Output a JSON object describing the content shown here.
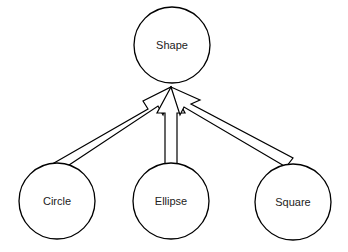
{
  "diagram": {
    "type": "inheritance",
    "nodes": [
      {
        "id": "shape",
        "label": "Shape",
        "cx": 172,
        "cy": 45,
        "r": 38
      },
      {
        "id": "circle",
        "label": "Circle",
        "cx": 57,
        "cy": 201,
        "r": 38
      },
      {
        "id": "ellipse",
        "label": "Ellipse",
        "cx": 171,
        "cy": 201,
        "r": 38
      },
      {
        "id": "square",
        "label": "Square",
        "cx": 293,
        "cy": 202,
        "r": 38
      }
    ],
    "edges": [
      {
        "from": "circle",
        "to": "shape",
        "style": "hollow-block-arrow"
      },
      {
        "from": "ellipse",
        "to": "shape",
        "style": "hollow-block-arrow"
      },
      {
        "from": "square",
        "to": "shape",
        "style": "hollow-block-arrow"
      }
    ],
    "colors": {
      "stroke": "#000000",
      "fill": "#ffffff",
      "text": "#222222"
    }
  }
}
